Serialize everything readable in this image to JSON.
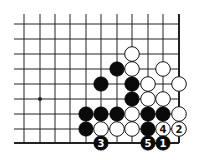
{
  "diagram": {
    "type": "go-board-fragment",
    "colors": {
      "line": "#222222",
      "black_stone": "#0a0a0a",
      "white_stone": "#ffffff",
      "background": "#ffffff"
    },
    "grid": {
      "cols_x": [
        24,
        40,
        55,
        70,
        86,
        101,
        117,
        132,
        148,
        163,
        179
      ],
      "rows_y": [
        24,
        39,
        54,
        69,
        84,
        99,
        114,
        129,
        143
      ],
      "open_left_x": 14,
      "open_top_y": 14,
      "right_edge": true,
      "bottom_edge": true
    },
    "hoshi": [
      {
        "col": 1,
        "row": 5
      }
    ],
    "stones": [
      {
        "color": "white",
        "col": 7,
        "row": 2
      },
      {
        "color": "black",
        "col": 6,
        "row": 3
      },
      {
        "color": "white",
        "col": 7,
        "row": 3
      },
      {
        "color": "white",
        "col": 9,
        "row": 3
      },
      {
        "color": "black",
        "col": 5,
        "row": 4
      },
      {
        "color": "black",
        "col": 7,
        "row": 4
      },
      {
        "color": "white",
        "col": 8,
        "row": 4
      },
      {
        "color": "white",
        "col": 10,
        "row": 4
      },
      {
        "color": "black",
        "col": 7,
        "row": 5
      },
      {
        "color": "white",
        "col": 8,
        "row": 5
      },
      {
        "color": "white",
        "col": 9,
        "row": 5
      },
      {
        "color": "black",
        "col": 4,
        "row": 6
      },
      {
        "color": "black",
        "col": 5,
        "row": 6
      },
      {
        "color": "black",
        "col": 6,
        "row": 6
      },
      {
        "color": "white",
        "col": 7,
        "row": 6
      },
      {
        "color": "black",
        "col": 8,
        "row": 6
      },
      {
        "color": "black",
        "col": 9,
        "row": 6
      },
      {
        "color": "white",
        "col": 10,
        "row": 6
      },
      {
        "color": "black",
        "col": 4,
        "row": 7
      },
      {
        "color": "white",
        "col": 5,
        "row": 7
      },
      {
        "color": "white",
        "col": 6,
        "row": 7
      },
      {
        "color": "white",
        "col": 7,
        "row": 7
      },
      {
        "color": "black",
        "col": 8,
        "row": 7
      },
      {
        "color": "white",
        "col": 9,
        "row": 7,
        "label": "4"
      },
      {
        "color": "white",
        "col": 10,
        "row": 7,
        "label": "2"
      },
      {
        "color": "black",
        "col": 5,
        "row": 8,
        "label": "3"
      },
      {
        "color": "black",
        "col": 8,
        "row": 8,
        "label": "5"
      },
      {
        "color": "black",
        "col": 9,
        "row": 8,
        "label": "1"
      }
    ],
    "move_labels": [
      "1",
      "2",
      "3",
      "4",
      "5"
    ]
  }
}
